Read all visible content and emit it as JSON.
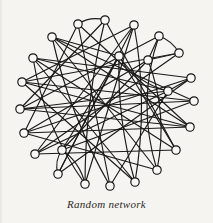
{
  "figure": {
    "caption": "Random network",
    "kind": "node-link-diagram",
    "background_color": "#f6f4f1",
    "node_fill_color": "#f8f7f5",
    "node_stroke_color": "#111111",
    "edge_color": "#1a1a1a",
    "node_radius": 4.2,
    "node_count": 24,
    "edge_count": 54
  },
  "chart_data": {
    "type": "scatter",
    "title": "Random network",
    "xlabel": "",
    "ylabel": "",
    "xlim": [
      0,
      213
    ],
    "ylim": [
      0,
      223
    ],
    "grid": false,
    "legend": "none",
    "nodes": [
      {
        "id": 0,
        "x": 78,
        "y": 24
      },
      {
        "id": 1,
        "x": 105,
        "y": 20
      },
      {
        "id": 2,
        "x": 134,
        "y": 25
      },
      {
        "id": 3,
        "x": 159,
        "y": 36
      },
      {
        "id": 4,
        "x": 179,
        "y": 53
      },
      {
        "id": 5,
        "x": 191,
        "y": 78
      },
      {
        "id": 6,
        "x": 194,
        "y": 101
      },
      {
        "id": 7,
        "x": 190,
        "y": 127
      },
      {
        "id": 8,
        "x": 176,
        "y": 150
      },
      {
        "id": 9,
        "x": 157,
        "y": 170
      },
      {
        "id": 10,
        "x": 135,
        "y": 182
      },
      {
        "id": 11,
        "x": 110,
        "y": 186
      },
      {
        "id": 12,
        "x": 85,
        "y": 184
      },
      {
        "id": 13,
        "x": 58,
        "y": 174
      },
      {
        "id": 14,
        "x": 35,
        "y": 154
      },
      {
        "id": 15,
        "x": 24,
        "y": 133
      },
      {
        "id": 16,
        "x": 20,
        "y": 109
      },
      {
        "id": 17,
        "x": 22,
        "y": 82
      },
      {
        "id": 18,
        "x": 33,
        "y": 58
      },
      {
        "id": 19,
        "x": 52,
        "y": 37
      },
      {
        "id": 20,
        "x": 148,
        "y": 60
      },
      {
        "id": 21,
        "x": 168,
        "y": 91
      },
      {
        "id": 22,
        "x": 62,
        "y": 150
      },
      {
        "id": 23,
        "x": 119,
        "y": 56
      }
    ],
    "edges": [
      {
        "source": 0,
        "target": 1,
        "curve": -6
      },
      {
        "source": 0,
        "target": 11,
        "curve": 0
      },
      {
        "source": 0,
        "target": 7,
        "curve": 0
      },
      {
        "source": 0,
        "target": 15,
        "curve": 0
      },
      {
        "source": 1,
        "target": 12,
        "curve": 10
      },
      {
        "source": 1,
        "target": 16,
        "curve": 0
      },
      {
        "source": 1,
        "target": 8,
        "curve": 0
      },
      {
        "source": 2,
        "target": 13,
        "curve": 0
      },
      {
        "source": 2,
        "target": 17,
        "curve": 0
      },
      {
        "source": 2,
        "target": 10,
        "curve": -14
      },
      {
        "source": 3,
        "target": 20,
        "curve": 0
      },
      {
        "source": 3,
        "target": 4,
        "curve": -5
      },
      {
        "source": 3,
        "target": 16,
        "curve": 0
      },
      {
        "source": 3,
        "target": 9,
        "curve": 22
      },
      {
        "source": 4,
        "target": 20,
        "curve": 0
      },
      {
        "source": 4,
        "target": 17,
        "curve": 0
      },
      {
        "source": 4,
        "target": 14,
        "curve": 0
      },
      {
        "source": 5,
        "target": 21,
        "curve": 0
      },
      {
        "source": 5,
        "target": 18,
        "curve": 0
      },
      {
        "source": 5,
        "target": 13,
        "curve": 0
      },
      {
        "source": 6,
        "target": 16,
        "curve": 0
      },
      {
        "source": 6,
        "target": 17,
        "curve": 0
      },
      {
        "source": 6,
        "target": 22,
        "curve": 0
      },
      {
        "source": 7,
        "target": 15,
        "curve": 0
      },
      {
        "source": 7,
        "target": 16,
        "curve": 0
      },
      {
        "source": 7,
        "target": 19,
        "curve": 0
      },
      {
        "source": 8,
        "target": 14,
        "curve": 0
      },
      {
        "source": 8,
        "target": 18,
        "curve": 0
      },
      {
        "source": 8,
        "target": 23,
        "curve": 0
      },
      {
        "source": 9,
        "target": 20,
        "curve": 16
      },
      {
        "source": 9,
        "target": 15,
        "curve": 0
      },
      {
        "source": 9,
        "target": 19,
        "curve": 0
      },
      {
        "source": 10,
        "target": 23,
        "curve": -10
      },
      {
        "source": 10,
        "target": 17,
        "curve": 0
      },
      {
        "source": 10,
        "target": 18,
        "curve": 0
      },
      {
        "source": 11,
        "target": 19,
        "curve": -12
      },
      {
        "source": 11,
        "target": 21,
        "curve": 0
      },
      {
        "source": 12,
        "target": 22,
        "curve": 8
      },
      {
        "source": 12,
        "target": 18,
        "curve": -16
      },
      {
        "source": 12,
        "target": 2,
        "curve": 0
      },
      {
        "source": 13,
        "target": 22,
        "curve": -6
      },
      {
        "source": 13,
        "target": 23,
        "curve": 0
      },
      {
        "source": 14,
        "target": 21,
        "curve": 0
      },
      {
        "source": 14,
        "target": 2,
        "curve": 0
      },
      {
        "source": 15,
        "target": 20,
        "curve": 0
      },
      {
        "source": 15,
        "target": 5,
        "curve": 0
      },
      {
        "source": 16,
        "target": 21,
        "curve": 0
      },
      {
        "source": 17,
        "target": 7,
        "curve": 0
      },
      {
        "source": 18,
        "target": 21,
        "curve": 0
      },
      {
        "source": 19,
        "target": 23,
        "curve": 0
      },
      {
        "source": 19,
        "target": 6,
        "curve": 0
      },
      {
        "source": 20,
        "target": 22,
        "curve": 0
      },
      {
        "source": 21,
        "target": 23,
        "curve": -12
      },
      {
        "source": 22,
        "target": 23,
        "curve": 0
      }
    ]
  }
}
